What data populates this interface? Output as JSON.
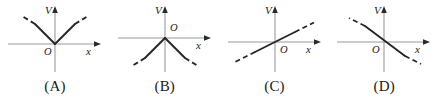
{
  "figure": {
    "axis_color": "#9a9a9a",
    "ray_color": "#262626",
    "caption_color": "#1a1a1a",
    "panels": [
      {
        "caption": "(A)",
        "v_axis_label": "V",
        "x_axis_label": "x",
        "origin_label": "O",
        "origin_label_position": "below-left",
        "description": "Two rays from the origin: one going up-left, one going up-right; each solid near the origin and dashed toward its outer end.",
        "graph_type": "two-rays",
        "rays": [
          {
            "name": "upper-left-ray",
            "direction": "up-left",
            "solid_fraction": 0.62,
            "dashed_end": true
          },
          {
            "name": "upper-right-ray",
            "direction": "up-right",
            "solid_fraction": 0.62,
            "dashed_end": true
          }
        ]
      },
      {
        "caption": "(B)",
        "v_axis_label": "V",
        "x_axis_label": "x",
        "origin_label": "O",
        "origin_label_position": "above-right",
        "description": "Two rays from the origin: one going down-left, one going down-right; each solid near the origin and dashed toward its outer end.",
        "graph_type": "two-rays",
        "rays": [
          {
            "name": "lower-left-ray",
            "direction": "down-left",
            "solid_fraction": 0.62,
            "dashed_end": true
          },
          {
            "name": "lower-right-ray",
            "direction": "down-right",
            "solid_fraction": 0.62,
            "dashed_end": true
          }
        ]
      },
      {
        "caption": "(C)",
        "v_axis_label": "V",
        "x_axis_label": "x",
        "origin_label": "O",
        "origin_label_position": "below-right",
        "description": "A single straight line of positive slope through the origin, solid in the middle and dashed at both ends.",
        "graph_type": "single-line",
        "line": {
          "name": "positive-slope-line",
          "slope_sign": "positive",
          "through_origin": true,
          "dashed_ends": true
        }
      },
      {
        "caption": "(D)",
        "v_axis_label": "V",
        "x_axis_label": "x",
        "origin_label": "O",
        "origin_label_position": "below-left",
        "description": "A single straight line of negative slope through the origin, solid in the middle and dashed at both ends.",
        "graph_type": "single-line",
        "line": {
          "name": "negative-slope-line",
          "slope_sign": "negative",
          "through_origin": true,
          "dashed_ends": true
        }
      }
    ]
  }
}
